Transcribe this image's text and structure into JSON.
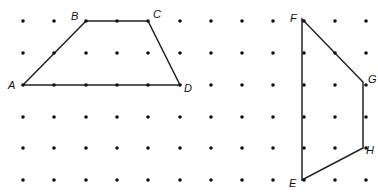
{
  "grid": {
    "xs": [
      23,
      54,
      86,
      117,
      148,
      180,
      211,
      242,
      273,
      304,
      335,
      366
    ],
    "ys": [
      21,
      53,
      85,
      117,
      148,
      180
    ],
    "dot_radius": 1.8,
    "dot_color": "#111111"
  },
  "shapes": [
    {
      "name": "trapezoid-abcd",
      "points": [
        [
          23,
          85
        ],
        [
          86,
          21
        ],
        [
          148,
          21
        ],
        [
          180,
          85
        ]
      ],
      "labels": [
        {
          "text": "A",
          "x": 8,
          "y": 89
        },
        {
          "text": "B",
          "x": 71,
          "y": 20
        },
        {
          "text": "C",
          "x": 153,
          "y": 18
        },
        {
          "text": "D",
          "x": 184,
          "y": 92
        }
      ]
    },
    {
      "name": "quadrilateral-efgh",
      "points": [
        [
          302,
          180
        ],
        [
          302,
          19
        ],
        [
          363,
          82
        ],
        [
          363,
          148
        ]
      ],
      "labels": [
        {
          "text": "F",
          "x": 290,
          "y": 22
        },
        {
          "text": "G",
          "x": 368,
          "y": 83
        },
        {
          "text": "H",
          "x": 366,
          "y": 154
        },
        {
          "text": "E",
          "x": 289,
          "y": 187
        }
      ]
    }
  ],
  "line_color": "#222222"
}
